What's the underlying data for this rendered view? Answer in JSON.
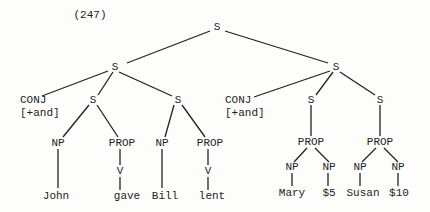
{
  "example_number": "(247)",
  "nodes": {
    "root": "S",
    "left_s": "S",
    "right_s": "S",
    "left_conj": "CONJ",
    "left_conj_feature": "[+and]",
    "left_s1": "S",
    "left_s2": "S",
    "right_conj": "CONJ",
    "right_conj_feature": "[+and]",
    "right_s1": "S",
    "right_s2": "S",
    "l1_np": "NP",
    "l1_prop": "PROP",
    "l1_v": "V",
    "l2_np": "NP",
    "l2_prop": "PROP",
    "l2_v": "V",
    "r1_prop": "PROP",
    "r1_np1": "NP",
    "r1_np2": "NP",
    "r2_prop": "PROP",
    "r2_np1": "NP",
    "r2_np2": "NP"
  },
  "leaves": {
    "john": "John",
    "gave": "gave",
    "bill": "Bill",
    "lent": "lent",
    "mary": "Mary",
    "five": "$5",
    "susan": "Susan",
    "ten": "$10"
  }
}
